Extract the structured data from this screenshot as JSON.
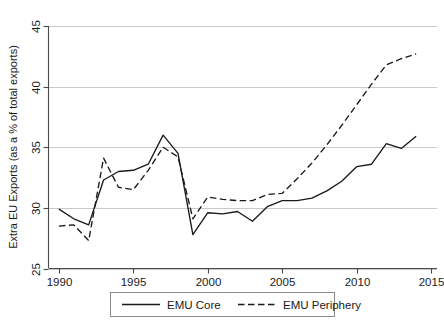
{
  "chart_data": {
    "type": "line",
    "title": "",
    "xlabel": "",
    "ylabel": "Extra EU Exports (as a % of total exports)",
    "xlim": [
      1989.3,
      2015.4
    ],
    "ylim": [
      25,
      45
    ],
    "grid": true,
    "legend_position": "bottom",
    "xticks": [
      1990,
      1995,
      2000,
      2005,
      2010,
      2015
    ],
    "xtick_labels": [
      "1990",
      "1995",
      "2000",
      "2005",
      "2010",
      "2015"
    ],
    "yticks": [
      25,
      30,
      35,
      40,
      45
    ],
    "ytick_labels": [
      "25",
      "30",
      "35",
      "40",
      "45"
    ],
    "x": [
      1990,
      1991,
      1992,
      1993,
      1994,
      1995,
      1996,
      1997,
      1998,
      1999,
      2000,
      2001,
      2002,
      2003,
      2004,
      2005,
      2006,
      2007,
      2008,
      2009,
      2010,
      2011,
      2012,
      2013,
      2014
    ],
    "series": [
      {
        "name": "EMU Core",
        "style": "solid",
        "color": "#1a1a1a",
        "values": [
          29.9,
          29.1,
          28.6,
          32.3,
          33.0,
          33.1,
          33.6,
          36.0,
          34.5,
          27.8,
          29.6,
          29.5,
          29.7,
          28.9,
          30.1,
          30.6,
          30.6,
          30.8,
          31.4,
          32.2,
          33.4,
          33.6,
          35.3,
          34.9,
          35.9
        ]
      },
      {
        "name": "EMU Periphery",
        "style": "dashed",
        "color": "#1a1a1a",
        "values": [
          28.5,
          28.6,
          27.3,
          34.1,
          31.7,
          31.5,
          33.1,
          35.0,
          34.2,
          29.1,
          30.9,
          30.7,
          30.6,
          30.6,
          31.1,
          31.2,
          32.4,
          33.7,
          35.2,
          36.8,
          38.5,
          40.2,
          41.8,
          42.3,
          42.7
        ]
      }
    ]
  },
  "legend": {
    "entries": [
      {
        "label": "EMU Core"
      },
      {
        "label": "EMU Periphery"
      }
    ]
  }
}
